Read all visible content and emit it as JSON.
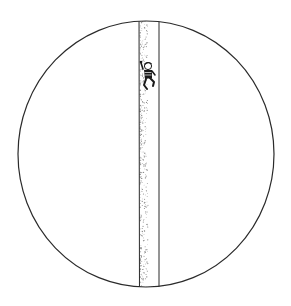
{
  "illustration": {
    "title": "Figure climbing a vertical column inside a circle",
    "description": "Pen-and-ink drawing: a large circle bisected by a narrow stippled vertical band; a small figure clings to the band near the top.",
    "colors": {
      "background": "#ffffff",
      "ink": "#2a2a2a",
      "stipple": "#8a8a8a"
    },
    "elements": [
      "circle-outline",
      "vertical-band",
      "climbing-figure"
    ]
  }
}
